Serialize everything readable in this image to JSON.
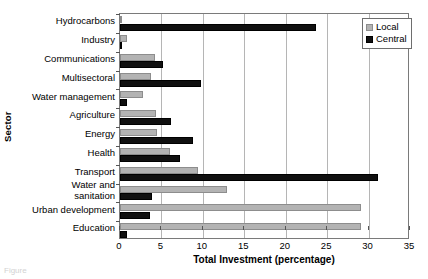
{
  "chart_data": {
    "type": "bar",
    "orientation": "horizontal",
    "title": "",
    "xlabel": "Total Investment (percentage)",
    "ylabel": "Sector",
    "xlim": [
      0,
      35
    ],
    "xticks": [
      0,
      5,
      10,
      15,
      20,
      25,
      30,
      35
    ],
    "grid": "vertical",
    "legend_position": "top-right",
    "categories": [
      "Hydrocarbons",
      "Industry",
      "Communications",
      "Multisectoral",
      "Water management",
      "Agriculture",
      "Energy",
      "Health",
      "Transport",
      "Water and\nsanitation",
      "Urban development",
      "Education"
    ],
    "series": [
      {
        "name": "Local",
        "color": "#b3b3b3",
        "values": [
          0.0,
          0.8,
          4.2,
          3.8,
          2.8,
          4.3,
          4.5,
          6.0,
          9.4,
          12.9,
          29.1,
          29.1
        ]
      },
      {
        "name": "Central",
        "color": "#101010",
        "values": [
          23.7,
          0.3,
          5.2,
          9.8,
          0.9,
          6.2,
          8.8,
          7.2,
          31.1,
          3.9,
          3.6,
          0.9
        ]
      }
    ]
  },
  "legend": {
    "items": [
      {
        "label": "Local"
      },
      {
        "label": "Central"
      }
    ]
  },
  "caption": "Figure"
}
